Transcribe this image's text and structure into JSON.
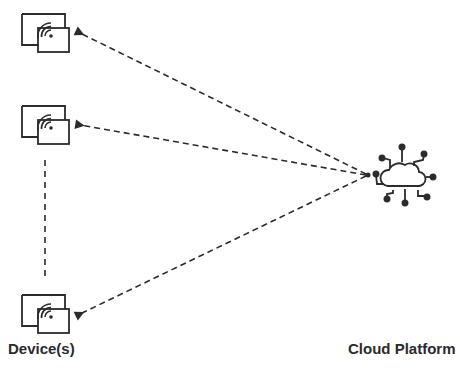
{
  "diagram": {
    "nodes": [
      {
        "id": "device-1",
        "type": "device",
        "icon": "device-wireless-icon"
      },
      {
        "id": "device-2",
        "type": "device",
        "icon": "device-wireless-icon"
      },
      {
        "id": "device-n",
        "type": "device",
        "icon": "device-wireless-icon"
      },
      {
        "id": "cloud",
        "type": "cloud-platform",
        "icon": "cloud-network-icon"
      }
    ],
    "edges": [
      {
        "from": "cloud",
        "to": "device-1",
        "style": "dashed-arrow"
      },
      {
        "from": "cloud",
        "to": "device-2",
        "style": "dashed-arrow"
      },
      {
        "from": "cloud",
        "to": "device-n",
        "style": "dashed-arrow"
      },
      {
        "from": "device-2",
        "to": "device-n",
        "style": "dashed-line"
      }
    ],
    "labels": {
      "devices": "Device(s)",
      "cloud": "Cloud Platform"
    },
    "colors": {
      "stroke": "#2b2b2b",
      "background": "#ffffff"
    }
  }
}
